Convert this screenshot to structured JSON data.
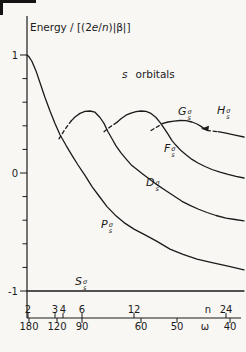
{
  "colors": {
    "background": "#f8f7f4",
    "ink": "#1b1b1b"
  },
  "y_axis": {
    "title_segments": [
      {
        "t": "Energy / [(2"
      },
      {
        "t": "e",
        "i": 1
      },
      {
        "t": "/"
      },
      {
        "t": "n",
        "i": 1
      },
      {
        "t": ")|β|]"
      }
    ],
    "x_px": 27,
    "top_px": 16,
    "bottom_px": 318,
    "E0_y_px": 173,
    "unit_px": 118,
    "major_ticks": [
      {
        "label": "1",
        "value": 1
      },
      {
        "label": "0",
        "value": 0
      },
      {
        "label": "-1",
        "value": -1
      }
    ],
    "minor_tick_values": [
      0.8,
      0.6,
      0.4,
      0.2,
      -0.2,
      -0.4,
      -0.6,
      -0.8
    ]
  },
  "x_axis": {
    "y_px": 318,
    "x0_px": 27,
    "x1_px": 241,
    "n_scale": {
      "name": "n",
      "name_x_px": 208,
      "ticks": [
        {
          "label": "2",
          "x_px": 28
        },
        {
          "label": "3",
          "x_px": 55
        },
        {
          "label": "4",
          "x_px": 63
        },
        {
          "label": "6",
          "x_px": 82
        },
        {
          "label": "12",
          "x_px": 134
        },
        {
          "label": "24",
          "x_px": 226
        }
      ]
    },
    "omega_scale": {
      "name": "ω",
      "name_x_px": 205,
      "ticks": [
        {
          "label": "180",
          "x_px": 29
        },
        {
          "label": "120",
          "x_px": 57
        },
        {
          "label": "90",
          "x_px": 82
        },
        {
          "label": "60",
          "x_px": 141
        },
        {
          "label": "50",
          "x_px": 177
        },
        {
          "label": "40",
          "x_px": 230
        }
      ]
    }
  },
  "annotation_segments": [
    {
      "t": "s",
      "i": 1
    },
    {
      "t": "orbitals"
    }
  ],
  "orbital_labels": [
    {
      "letter": "S",
      "sup": "σ",
      "sub": "s",
      "x": 75,
      "y": 275
    },
    {
      "letter": "P",
      "sup": "σ",
      "sub": "s",
      "x": 101,
      "y": 218
    },
    {
      "letter": "D",
      "sup": "σ",
      "sub": "s",
      "x": 146,
      "y": 176
    },
    {
      "letter": "F",
      "sup": "σ",
      "sub": "s",
      "x": 164,
      "y": 142
    },
    {
      "letter": "G",
      "sup": "σ",
      "sub": "s",
      "x": 178,
      "y": 105
    },
    {
      "letter": "H",
      "sup": "σ",
      "sub": "s",
      "x": 217,
      "y": 104
    }
  ],
  "chart_data": {
    "type": "line",
    "ylabel": "Energy / [(2e/n)|β|]",
    "xlabel": "dual scale: ring size n (top) and angle ω in degrees (bottom), nonlinear",
    "ylim": [
      -1.15,
      1.3
    ],
    "x_ticks_n": [
      2,
      3,
      4,
      6,
      12,
      24
    ],
    "x_ticks_omega": [
      180,
      120,
      90,
      60,
      50,
      40
    ],
    "grid": false,
    "annotations": [
      {
        "type": "arrow",
        "x_px": 205,
        "E": 0.375,
        "dir": "left"
      }
    ],
    "series": [
      {
        "name": "S_s_sigma",
        "segments": [
          {
            "dash": false,
            "points": [
              [
                27,
                -1.0
              ],
              [
                244,
                -1.0
              ]
            ]
          }
        ]
      },
      {
        "name": "P_s_sigma",
        "segments": [
          {
            "dash": false,
            "points": [
              [
                27,
                1.0
              ],
              [
                29,
                0.985
              ],
              [
                32,
                0.945
              ],
              [
                36,
                0.865
              ],
              [
                40,
                0.765
              ],
              [
                45,
                0.64
              ],
              [
                50,
                0.525
              ],
              [
                55,
                0.42
              ],
              [
                60,
                0.325
              ],
              [
                66,
                0.235
              ],
              [
                72,
                0.15
              ],
              [
                78,
                0.068
              ],
              [
                85,
                -0.02
              ],
              [
                92,
                -0.115
              ],
              [
                99,
                -0.195
              ],
              [
                107,
                -0.285
              ],
              [
                115,
                -0.355
              ],
              [
                124,
                -0.42
              ],
              [
                134,
                -0.475
              ],
              [
                145,
                -0.525
              ],
              [
                157,
                -0.58
              ],
              [
                170,
                -0.645
              ],
              [
                183,
                -0.69
              ],
              [
                197,
                -0.73
              ],
              [
                212,
                -0.76
              ],
              [
                228,
                -0.79
              ],
              [
                244,
                -0.82
              ]
            ]
          }
        ]
      },
      {
        "name": "D_s_sigma",
        "segments": [
          {
            "dash": true,
            "points": [
              [
                59,
                0.29
              ],
              [
                65,
                0.37
              ],
              [
                71,
                0.44
              ]
            ]
          },
          {
            "dash": false,
            "points": [
              [
                71,
                0.44
              ],
              [
                75,
                0.475
              ],
              [
                80,
                0.505
              ],
              [
                85,
                0.522
              ],
              [
                90,
                0.525
              ],
              [
                95,
                0.515
              ],
              [
                100,
                0.47
              ],
              [
                104,
                0.42
              ],
              [
                108,
                0.35
              ],
              [
                112,
                0.29
              ],
              [
                116,
                0.23
              ],
              [
                121,
                0.17
              ],
              [
                126,
                0.12
              ],
              [
                131,
                0.07
              ],
              [
                137,
                0.03
              ],
              [
                143,
                -0.01
              ],
              [
                150,
                -0.055
              ],
              [
                158,
                -0.105
              ],
              [
                166,
                -0.15
              ],
              [
                174,
                -0.195
              ],
              [
                182,
                -0.24
              ],
              [
                190,
                -0.275
              ],
              [
                198,
                -0.305
              ],
              [
                207,
                -0.335
              ],
              [
                216,
                -0.36
              ],
              [
                226,
                -0.382
              ],
              [
                235,
                -0.394
              ],
              [
                244,
                -0.405
              ]
            ]
          }
        ]
      },
      {
        "name": "F_s_sigma",
        "segments": [
          {
            "dash": true,
            "points": [
              [
                104,
                0.35
              ],
              [
                110,
                0.39
              ],
              [
                117,
                0.43
              ]
            ]
          },
          {
            "dash": false,
            "points": [
              [
                117,
                0.43
              ],
              [
                121,
                0.46
              ],
              [
                126,
                0.49
              ],
              [
                131,
                0.508
              ],
              [
                136,
                0.52
              ],
              [
                141,
                0.525
              ],
              [
                146,
                0.522
              ],
              [
                151,
                0.505
              ],
              [
                156,
                0.47
              ],
              [
                160,
                0.43
              ],
              [
                164,
                0.38
              ],
              [
                168,
                0.33
              ],
              [
                172,
                0.275
              ],
              [
                176,
                0.235
              ],
              [
                181,
                0.19
              ],
              [
                186,
                0.155
              ],
              [
                192,
                0.115
              ],
              [
                198,
                0.085
              ],
              [
                205,
                0.055
              ],
              [
                212,
                0.03
              ],
              [
                220,
                0.008
              ],
              [
                228,
                -0.012
              ],
              [
                236,
                -0.028
              ],
              [
                244,
                -0.042
              ]
            ]
          }
        ]
      },
      {
        "name": "G_s_sigma",
        "segments": [
          {
            "dash": true,
            "points": [
              [
                151,
                0.36
              ],
              [
                157,
                0.39
              ],
              [
                163,
                0.42
              ]
            ]
          },
          {
            "dash": false,
            "points": [
              [
                163,
                0.42
              ],
              [
                168,
                0.432
              ],
              [
                174,
                0.44
              ],
              [
                180,
                0.445
              ],
              [
                186,
                0.443
              ],
              [
                192,
                0.432
              ],
              [
                197,
                0.415
              ],
              [
                201,
                0.395
              ],
              [
                205,
                0.37
              ]
            ]
          }
        ]
      },
      {
        "name": "H_s_sigma",
        "segments": [
          {
            "dash": true,
            "points": [
              [
                207,
                0.362
              ],
              [
                212,
                0.356
              ],
              [
                218,
                0.35
              ]
            ]
          },
          {
            "dash": false,
            "points": [
              [
                218,
                0.35
              ],
              [
                226,
                0.337
              ],
              [
                235,
                0.321
              ],
              [
                244,
                0.305
              ]
            ]
          }
        ]
      }
    ]
  }
}
